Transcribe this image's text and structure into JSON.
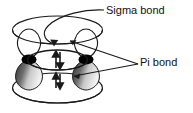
{
  "figure": {
    "type": "molecular-orbital-diagram",
    "background_color": "#ffffff",
    "stroke_color": "#1a1a1a",
    "nucleus_color": "#000000",
    "lobe_top_fill": "#ffffff",
    "lobe_bottom_fill_dark": "#3a3a3a",
    "lobe_bottom_fill_light": "#e8e8e8"
  },
  "labels": {
    "sigma": "Sigma bond",
    "pi": "Pi bond"
  },
  "annotations": {
    "sigma_leader": "curved arrow from Sigma bond text down to central sigma ellipse",
    "pi_leader": "two straight leader lines from Pi bond text to upper and lower pi lobes"
  },
  "electrons": {
    "sigma_pair": {
      "up": "↑",
      "down": "↓",
      "count": 2
    },
    "pi_pair": {
      "up": "↑",
      "down": "↓",
      "count": 2
    }
  },
  "atoms": [
    {
      "name": "left-nucleus",
      "cx": 29,
      "cy": 60
    },
    {
      "name": "right-nucleus",
      "cx": 86,
      "cy": 60
    }
  ]
}
